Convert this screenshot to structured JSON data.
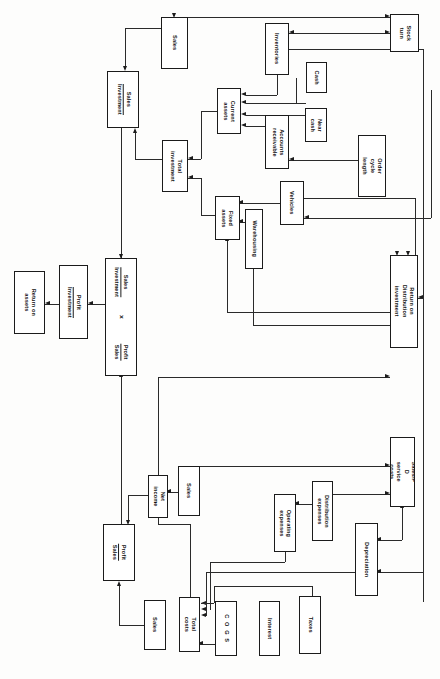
{
  "diagram": {
    "orientation": "landscape-rotated",
    "nodes": [
      {
        "id": "return-on-assets",
        "label": "Return on\nassets",
        "x": 14,
        "y": 271,
        "w": 31,
        "h": 63
      },
      {
        "id": "profit-investment",
        "label": "Profit\nInvestment",
        "x": 59,
        "y": 265,
        "w": 29,
        "h": 74,
        "fraction": true,
        "num": "Profit",
        "den": "Investment"
      },
      {
        "id": "ratio-stack",
        "label": "Sales\nInvestment  ×  Profit\nSales",
        "x": 105,
        "y": 258,
        "w": 32,
        "h": 118,
        "composite": true,
        "top_num": "Sales",
        "top_den": "Investment",
        "operator": "×",
        "bottom_num": "Profit",
        "bottom_den": "Sales"
      },
      {
        "id": "sales-investment-top",
        "label": "Sales\nInvestment",
        "x": 107,
        "y": 71,
        "w": 32,
        "h": 57,
        "fraction": true,
        "num": "Sales",
        "den": "Investment"
      },
      {
        "id": "sales-top",
        "label": "Sales",
        "x": 161,
        "y": 17,
        "w": 27,
        "h": 52
      },
      {
        "id": "total-investment",
        "label": "Total\ninvestment",
        "x": 162,
        "y": 140,
        "w": 26,
        "h": 52
      },
      {
        "id": "current-assets",
        "label": "Current\nassets",
        "x": 217,
        "y": 88,
        "w": 24,
        "h": 46
      },
      {
        "id": "fixed-assets",
        "label": "Fixed\nassets",
        "x": 215,
        "y": 196,
        "w": 25,
        "h": 44
      },
      {
        "id": "warehousing",
        "label": "Warehousing",
        "x": 245,
        "y": 209,
        "w": 18,
        "h": 60
      },
      {
        "id": "inventories",
        "label": "Inventories",
        "x": 265,
        "y": 23,
        "w": 24,
        "h": 52
      },
      {
        "id": "cash",
        "label": "Cash",
        "x": 306,
        "y": 62,
        "w": 21,
        "h": 31
      },
      {
        "id": "near-cash",
        "label": "Near\ncash",
        "x": 305,
        "y": 108,
        "w": 22,
        "h": 34
      },
      {
        "id": "accounts-receivable",
        "label": "Accounts\nreceivable",
        "x": 265,
        "y": 115,
        "w": 24,
        "h": 54
      },
      {
        "id": "order-cycle-length",
        "label": "Order cycle\nlength",
        "x": 358,
        "y": 135,
        "w": 28,
        "h": 62
      },
      {
        "id": "vehicles",
        "label": "Vehicles",
        "x": 280,
        "y": 181,
        "w": 24,
        "h": 44
      },
      {
        "id": "stock-turn",
        "label": "Stock\nturn",
        "x": 390,
        "y": 14,
        "w": 29,
        "h": 38
      },
      {
        "id": "return-on-distribution",
        "label": "Return on Distribution\ninvestment",
        "x": 390,
        "y": 255,
        "w": 28,
        "h": 93
      },
      {
        "id": "sales-pd-service",
        "label": "Sales/P D\nservice costs",
        "x": 390,
        "y": 437,
        "w": 25,
        "h": 70
      },
      {
        "id": "profit-sales-lower",
        "label": "Profit\nSales",
        "x": 103,
        "y": 524,
        "w": 32,
        "h": 57,
        "fraction": true,
        "num": "Profit",
        "den": "Sales"
      },
      {
        "id": "net-income",
        "label": "Net\nincome",
        "x": 148,
        "y": 475,
        "w": 20,
        "h": 43
      },
      {
        "id": "sales-net",
        "label": "Sales",
        "x": 178,
        "y": 466,
        "w": 22,
        "h": 50
      },
      {
        "id": "sales-costs",
        "label": "Sales",
        "x": 144,
        "y": 600,
        "w": 22,
        "h": 50
      },
      {
        "id": "total-costs",
        "label": "Total\ncosts",
        "x": 179,
        "y": 597,
        "w": 21,
        "h": 55
      },
      {
        "id": "cogs",
        "label": "C O G S",
        "x": 215,
        "y": 601,
        "w": 22,
        "h": 55,
        "wide": true
      },
      {
        "id": "interest",
        "label": "Interest",
        "x": 259,
        "y": 601,
        "w": 21,
        "h": 55
      },
      {
        "id": "taxes",
        "label": "Taxes",
        "x": 299,
        "y": 596,
        "w": 22,
        "h": 58
      },
      {
        "id": "operating-expenses",
        "label": "Operating\nexpenses",
        "x": 274,
        "y": 494,
        "w": 22,
        "h": 58
      },
      {
        "id": "distribution-expenses",
        "label": "Distribution\nexpenses",
        "x": 312,
        "y": 481,
        "w": 21,
        "h": 60
      },
      {
        "id": "depreciation",
        "label": "Depreciation",
        "x": 355,
        "y": 523,
        "w": 23,
        "h": 73
      }
    ],
    "colors": {
      "background": "#fdfdfc",
      "box_fill": "#ffffff",
      "box_stroke": "#1b1b1b",
      "connector": "#2a2a2a",
      "text": "#111111"
    }
  }
}
